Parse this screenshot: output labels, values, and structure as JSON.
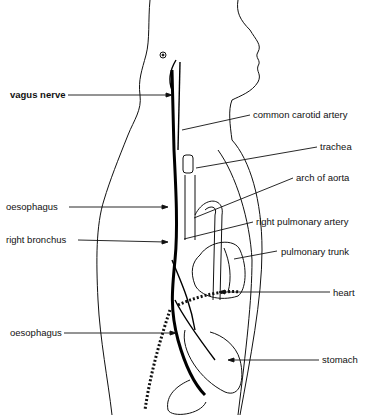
{
  "diagram": {
    "labels": {
      "vagus_nerve": "vagus nerve",
      "common_carotid_artery": "common carotid artery",
      "trachea": "trachea",
      "arch_of_aorta": "arch of aorta",
      "oesophagus_upper": "oesophagus",
      "right_pulmonary_artery": "right pulmonary artery",
      "right_bronchus": "right bronchus",
      "pulmonary_trunk": "pulmonary trunk",
      "heart": "heart",
      "oesophagus_lower": "oesophagus",
      "stomach": "stomach"
    }
  }
}
